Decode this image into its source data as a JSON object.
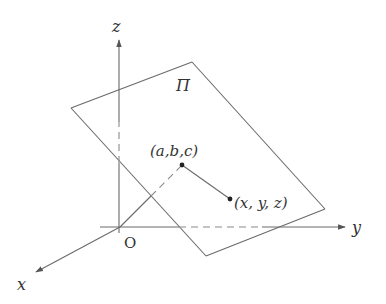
{
  "diagram": {
    "axes": {
      "x": {
        "label": "x"
      },
      "y": {
        "label": "y"
      },
      "z": {
        "label": "z"
      },
      "origin": {
        "label": "O"
      }
    },
    "plane": {
      "label": "Π"
    },
    "points": [
      {
        "id": "fixed",
        "label": "(a,b,c)"
      },
      {
        "id": "variable",
        "label": "(x, y, z)"
      }
    ],
    "colors": {
      "stroke": "#6a6a6a",
      "dashed": "#8a8a8a",
      "text": "#333333",
      "point": "#222222"
    }
  }
}
